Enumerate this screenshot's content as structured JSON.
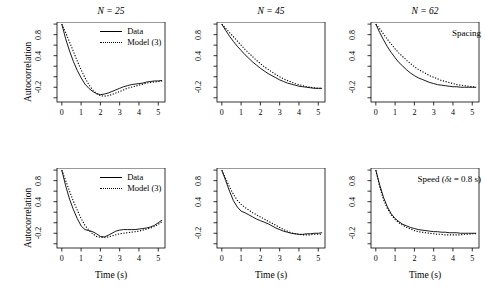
{
  "figure": {
    "axis_label_y": "Autocorrelation",
    "axis_label_x": "Time (s)",
    "line_color": "#000000",
    "background": "#ffffff"
  },
  "legend": {
    "data_label": "Data",
    "model_label": "Model (3)"
  },
  "row_annotations": {
    "top": "Spacing",
    "bottom_prefix": "Speed (",
    "bottom_symbol": "δt",
    "bottom_suffix": " = 0.8 s)"
  },
  "axes": {
    "x_ticks": [
      "0",
      "1",
      "2",
      "3",
      "4",
      "5"
    ],
    "y_ticks": [
      "0.8",
      "0.4",
      "-0.2"
    ],
    "xlim": [
      -0.25,
      5.35
    ],
    "ylim": [
      -0.48,
      1.04
    ]
  },
  "chart_data": {
    "type": "line",
    "title": "",
    "xlabel": "Time (s)",
    "ylabel": "Autocorrelation",
    "xlim": [
      -0.25,
      5.35
    ],
    "ylim": [
      -0.48,
      1.04
    ],
    "x_ticks": [
      0,
      1,
      2,
      3,
      4,
      5
    ],
    "y_ticks": [
      0.8,
      0.4,
      -0.2
    ],
    "grid": false,
    "legend_position": "top-right",
    "panels": [
      {
        "id": "top-left",
        "row": "Spacing",
        "title": "N = 25",
        "N": 25,
        "has_legend": true,
        "annotation": "",
        "x": [
          0,
          0.2,
          0.4,
          0.6,
          0.8,
          1.0,
          1.2,
          1.4,
          1.6,
          1.8,
          2.0,
          2.2,
          2.4,
          2.6,
          2.8,
          3.0,
          3.2,
          3.4,
          3.6,
          3.8,
          4.0,
          4.2,
          4.4,
          4.6,
          4.8,
          5.0,
          5.2
        ],
        "series": [
          {
            "name": "Data",
            "style": "solid",
            "values": [
              1.0,
              0.72,
              0.49,
              0.29,
              0.12,
              -0.02,
              -0.14,
              -0.22,
              -0.28,
              -0.32,
              -0.34,
              -0.33,
              -0.31,
              -0.28,
              -0.25,
              -0.22,
              -0.19,
              -0.17,
              -0.15,
              -0.14,
              -0.13,
              -0.12,
              -0.1,
              -0.09,
              -0.08,
              -0.08,
              -0.07
            ]
          },
          {
            "name": "Model (3)",
            "style": "dotted",
            "values": [
              1.0,
              0.84,
              0.66,
              0.48,
              0.3,
              0.13,
              -0.02,
              -0.15,
              -0.25,
              -0.32,
              -0.36,
              -0.37,
              -0.36,
              -0.34,
              -0.31,
              -0.28,
              -0.25,
              -0.22,
              -0.2,
              -0.18,
              -0.16,
              -0.14,
              -0.12,
              -0.11,
              -0.1,
              -0.09,
              -0.08
            ]
          }
        ]
      },
      {
        "id": "top-middle",
        "row": "Spacing",
        "title": "N = 45",
        "N": 45,
        "has_legend": false,
        "annotation": "",
        "x": [
          0,
          0.2,
          0.4,
          0.6,
          0.8,
          1.0,
          1.2,
          1.4,
          1.6,
          1.8,
          2.0,
          2.2,
          2.4,
          2.6,
          2.8,
          3.0,
          3.2,
          3.4,
          3.6,
          3.8,
          4.0,
          4.2,
          4.4,
          4.6,
          4.8,
          5.0,
          5.2
        ],
        "series": [
          {
            "name": "Data",
            "style": "solid",
            "values": [
              1.0,
              0.88,
              0.77,
              0.67,
              0.58,
              0.5,
              0.42,
              0.35,
              0.28,
              0.22,
              0.16,
              0.11,
              0.06,
              0.02,
              -0.02,
              -0.06,
              -0.09,
              -0.12,
              -0.14,
              -0.16,
              -0.18,
              -0.19,
              -0.2,
              -0.21,
              -0.22,
              -0.22,
              -0.22
            ]
          },
          {
            "name": "Model (3)",
            "style": "dotted",
            "values": [
              1.0,
              0.92,
              0.84,
              0.76,
              0.68,
              0.6,
              0.52,
              0.45,
              0.38,
              0.31,
              0.25,
              0.19,
              0.14,
              0.09,
              0.04,
              0.0,
              -0.04,
              -0.07,
              -0.1,
              -0.13,
              -0.15,
              -0.17,
              -0.19,
              -0.2,
              -0.21,
              -0.22,
              -0.22
            ]
          }
        ]
      },
      {
        "id": "top-right",
        "row": "Spacing",
        "title": "N = 62",
        "N": 62,
        "has_legend": false,
        "annotation": "Spacing",
        "x": [
          0,
          0.2,
          0.4,
          0.6,
          0.8,
          1.0,
          1.2,
          1.4,
          1.6,
          1.8,
          2.0,
          2.2,
          2.4,
          2.6,
          2.8,
          3.0,
          3.2,
          3.4,
          3.6,
          3.8,
          4.0,
          4.2,
          4.4,
          4.6,
          4.8,
          5.0,
          5.2
        ],
        "series": [
          {
            "name": "Data",
            "style": "solid",
            "values": [
              1.0,
              0.84,
              0.7,
              0.57,
              0.46,
              0.36,
              0.27,
              0.2,
              0.13,
              0.07,
              0.02,
              -0.02,
              -0.05,
              -0.08,
              -0.11,
              -0.13,
              -0.15,
              -0.16,
              -0.17,
              -0.18,
              -0.19,
              -0.19,
              -0.2,
              -0.2,
              -0.2,
              -0.2,
              -0.2
            ]
          },
          {
            "name": "Model (3)",
            "style": "dotted",
            "values": [
              1.0,
              0.91,
              0.81,
              0.71,
              0.62,
              0.53,
              0.45,
              0.38,
              0.31,
              0.25,
              0.19,
              0.14,
              0.1,
              0.06,
              0.02,
              -0.01,
              -0.04,
              -0.07,
              -0.09,
              -0.11,
              -0.13,
              -0.15,
              -0.16,
              -0.17,
              -0.18,
              -0.19,
              -0.2
            ]
          }
        ]
      },
      {
        "id": "bottom-left",
        "row": "Speed",
        "title": "",
        "N": 25,
        "has_legend": true,
        "annotation": "",
        "x": [
          0,
          0.2,
          0.4,
          0.6,
          0.8,
          1.0,
          1.2,
          1.4,
          1.6,
          1.8,
          2.0,
          2.2,
          2.4,
          2.6,
          2.8,
          3.0,
          3.2,
          3.4,
          3.6,
          3.8,
          4.0,
          4.2,
          4.4,
          4.6,
          4.8,
          5.0,
          5.2
        ],
        "series": [
          {
            "name": "Data",
            "style": "solid",
            "values": [
              1.0,
              0.7,
              0.45,
              0.25,
              0.08,
              -0.06,
              -0.13,
              -0.15,
              -0.17,
              -0.21,
              -0.26,
              -0.27,
              -0.24,
              -0.2,
              -0.16,
              -0.14,
              -0.13,
              -0.13,
              -0.13,
              -0.13,
              -0.12,
              -0.11,
              -0.1,
              -0.08,
              -0.05,
              0.0,
              0.05
            ]
          },
          {
            "name": "Model (3)",
            "style": "dotted",
            "values": [
              1.0,
              0.8,
              0.6,
              0.41,
              0.24,
              0.08,
              -0.05,
              -0.14,
              -0.21,
              -0.26,
              -0.28,
              -0.28,
              -0.27,
              -0.25,
              -0.23,
              -0.21,
              -0.2,
              -0.19,
              -0.18,
              -0.17,
              -0.16,
              -0.14,
              -0.12,
              -0.1,
              -0.07,
              -0.03,
              0.02
            ]
          }
        ]
      },
      {
        "id": "bottom-middle",
        "row": "Speed",
        "title": "",
        "N": 45,
        "has_legend": false,
        "annotation": "",
        "x": [
          0,
          0.2,
          0.4,
          0.6,
          0.8,
          1.0,
          1.2,
          1.4,
          1.6,
          1.8,
          2.0,
          2.2,
          2.4,
          2.6,
          2.8,
          3.0,
          3.2,
          3.4,
          3.6,
          3.8,
          4.0,
          4.2,
          4.4,
          4.6,
          4.8,
          5.0,
          5.2
        ],
        "series": [
          {
            "name": "Data",
            "style": "solid",
            "values": [
              1.0,
              0.8,
              0.6,
              0.42,
              0.3,
              0.22,
              0.19,
              0.15,
              0.11,
              0.07,
              0.04,
              0.01,
              -0.02,
              -0.06,
              -0.1,
              -0.13,
              -0.16,
              -0.18,
              -0.2,
              -0.21,
              -0.22,
              -0.22,
              -0.21,
              -0.21,
              -0.2,
              -0.2,
              -0.19
            ]
          },
          {
            "name": "Model (3)",
            "style": "dotted",
            "values": [
              1.0,
              0.84,
              0.68,
              0.54,
              0.43,
              0.35,
              0.29,
              0.24,
              0.19,
              0.15,
              0.11,
              0.07,
              0.03,
              -0.01,
              -0.05,
              -0.09,
              -0.13,
              -0.16,
              -0.19,
              -0.21,
              -0.22,
              -0.23,
              -0.23,
              -0.23,
              -0.22,
              -0.22,
              -0.22
            ]
          }
        ]
      },
      {
        "id": "bottom-right",
        "row": "Speed",
        "title": "",
        "N": 62,
        "has_legend": false,
        "annotation": "Speed (δt = 0.8 s)",
        "x": [
          0,
          0.2,
          0.4,
          0.6,
          0.8,
          1.0,
          1.2,
          1.4,
          1.6,
          1.8,
          2.0,
          2.2,
          2.4,
          2.6,
          2.8,
          3.0,
          3.2,
          3.4,
          3.6,
          3.8,
          4.0,
          4.2,
          4.4,
          4.6,
          4.8,
          5.0,
          5.2
        ],
        "series": [
          {
            "name": "Data",
            "style": "solid",
            "values": [
              1.0,
              0.72,
              0.48,
              0.3,
              0.17,
              0.08,
              0.02,
              -0.03,
              -0.06,
              -0.09,
              -0.11,
              -0.13,
              -0.14,
              -0.15,
              -0.16,
              -0.17,
              -0.17,
              -0.18,
              -0.18,
              -0.19,
              -0.19,
              -0.19,
              -0.2,
              -0.2,
              -0.2,
              -0.2,
              -0.2
            ]
          },
          {
            "name": "Model (3)",
            "style": "dotted",
            "values": [
              1.0,
              0.68,
              0.44,
              0.27,
              0.15,
              0.06,
              0.0,
              -0.05,
              -0.09,
              -0.12,
              -0.15,
              -0.17,
              -0.18,
              -0.19,
              -0.2,
              -0.21,
              -0.22,
              -0.22,
              -0.23,
              -0.23,
              -0.23,
              -0.23,
              -0.23,
              -0.22,
              -0.22,
              -0.21,
              -0.21
            ]
          }
        ]
      }
    ]
  }
}
